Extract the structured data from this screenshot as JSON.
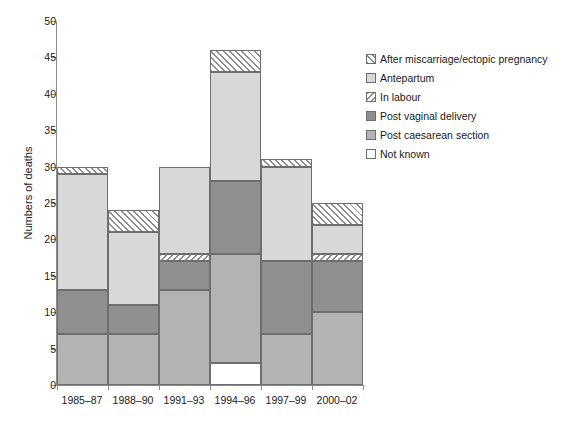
{
  "chart_data": {
    "type": "bar",
    "stacked": true,
    "title": "",
    "xlabel": "",
    "ylabel": "Numbers of deaths",
    "ylim": [
      0,
      50
    ],
    "ytick_step": 5,
    "yticks": [
      "0",
      "5",
      "10",
      "15",
      "20",
      "25",
      "30",
      "35",
      "40",
      "45",
      "50"
    ],
    "grid": false,
    "legend_position": "right-top",
    "categories": [
      "1985–87",
      "1988–90",
      "1991–93",
      "1994–96",
      "1997–99",
      "2000–02"
    ],
    "series": [
      {
        "name": "Not known",
        "key": "notknown",
        "swatch": "white-open",
        "values": [
          0,
          0,
          0,
          3,
          0,
          0
        ]
      },
      {
        "name": "Post caesarean section",
        "key": "postcaes",
        "swatch": "light-grey-solid",
        "values": [
          7,
          7,
          13,
          15,
          7,
          10
        ]
      },
      {
        "name": "Post vaginal delivery",
        "key": "postvag",
        "swatch": "dark-grey-solid",
        "values": [
          6,
          4,
          4,
          10,
          10,
          7
        ]
      },
      {
        "name": "In labour",
        "key": "inlabour",
        "swatch": "cross-hatch",
        "values": [
          0,
          0,
          1,
          0,
          0,
          1
        ]
      },
      {
        "name": "Antepartum",
        "key": "antepartum",
        "swatch": "pale-grey-solid",
        "values": [
          16,
          10,
          12,
          15,
          13,
          4
        ]
      },
      {
        "name": "After miscarriage/ectopic pregnancy",
        "key": "aftermis",
        "swatch": "diagonal-hatch",
        "values": [
          1,
          3,
          0,
          3,
          1,
          3
        ]
      }
    ],
    "stack_order_bottom_to_top": [
      "notknown",
      "postcaes",
      "postvag",
      "inlabour",
      "antepartum",
      "aftermis"
    ],
    "totals": [
      30,
      24,
      30,
      46,
      31,
      25
    ],
    "colors": {
      "not_known": "#ffffff",
      "post_caesarean_section": "#b3b3b3",
      "post_vaginal_delivery": "#8f8f8f",
      "in_labour": "#8a8a8a",
      "antepartum": "#d8d8d8",
      "after_miscarriage": "#8a8a8a",
      "axis": "#8c8c8c",
      "outline": "#6e6e6e",
      "text": "#1a1a1a"
    }
  },
  "legend": {
    "items": [
      {
        "label": "After miscarriage/ectopic pregnancy",
        "fill_class": "fill-aftermis",
        "name": "legend-item-after-miscarriage"
      },
      {
        "label": "Antepartum",
        "fill_class": "fill-antepartum",
        "name": "legend-item-antepartum"
      },
      {
        "label": "In labour",
        "fill_class": "fill-inlabour",
        "name": "legend-item-in-labour"
      },
      {
        "label": "Post vaginal delivery",
        "fill_class": "fill-postvag",
        "name": "legend-item-post-vaginal-delivery"
      },
      {
        "label": "Post caesarean section",
        "fill_class": "fill-postcaes",
        "name": "legend-item-post-caesarean-section"
      },
      {
        "label": "Not known",
        "fill_class": "fill-notknown",
        "name": "legend-item-not-known"
      }
    ]
  },
  "axes": {
    "y_title": "Numbers of deaths"
  }
}
